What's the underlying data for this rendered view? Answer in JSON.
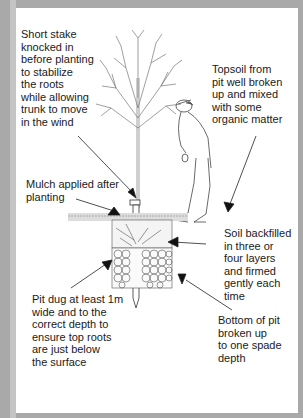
{
  "diagram": {
    "title": "",
    "colors": {
      "frame": "#a9a9a9",
      "panel": "#ffffff",
      "ink": "#1a1a1a"
    },
    "annotations": [
      {
        "id": "stake",
        "text": "Short stake\nknocked in\nbefore planting\nto stabilize\nthe roots\nwhile allowing\ntrunk to move\nin the wind"
      },
      {
        "id": "topsoil",
        "text": "Topsoil from\npit well broken\nup and mixed\nwith some\norganic matter"
      },
      {
        "id": "mulch",
        "text": "Mulch applied after\nplanting"
      },
      {
        "id": "backfill",
        "text": "Soil backfilled\nin three or\nfour layers\nand firmed\ngently each\ntime"
      },
      {
        "id": "pit",
        "text": "Pit dug at least 1m\nwide and to the\ncorrect depth to\nensure top roots\nare just below\nthe surface"
      },
      {
        "id": "bottom",
        "text": "Bottom of pit\nbroken up\nto one spade\ndepth"
      }
    ],
    "illustration": {
      "elements": [
        "tree",
        "stake",
        "gardener-figure",
        "mulch-layer",
        "backfilled-soil",
        "planting-pit"
      ]
    }
  }
}
